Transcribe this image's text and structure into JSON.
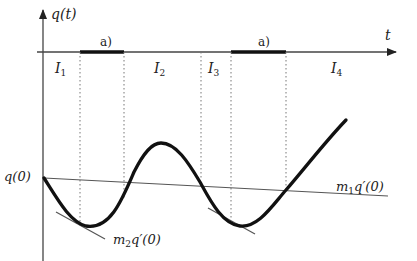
{
  "diagram": {
    "y_axis_label": "q(t)",
    "t_axis_label": "t",
    "intervals": [
      {
        "name": "I",
        "sub": "1"
      },
      {
        "name": "I",
        "sub": "2"
      },
      {
        "name": "I",
        "sub": "3"
      },
      {
        "name": "I",
        "sub": "4"
      }
    ],
    "segment_labels": [
      "a)",
      "a)"
    ],
    "initial_value_label": "q(0)",
    "tangent_labels": {
      "m1": {
        "m": "m",
        "sub": "1",
        "rest": "q′(0)"
      },
      "m2": {
        "m": "m",
        "sub": "2",
        "rest": "q′(0)"
      }
    },
    "colors": {
      "curve": "#111111",
      "axis": "#444444",
      "line": "#555555",
      "dotted": "#777777"
    }
  }
}
